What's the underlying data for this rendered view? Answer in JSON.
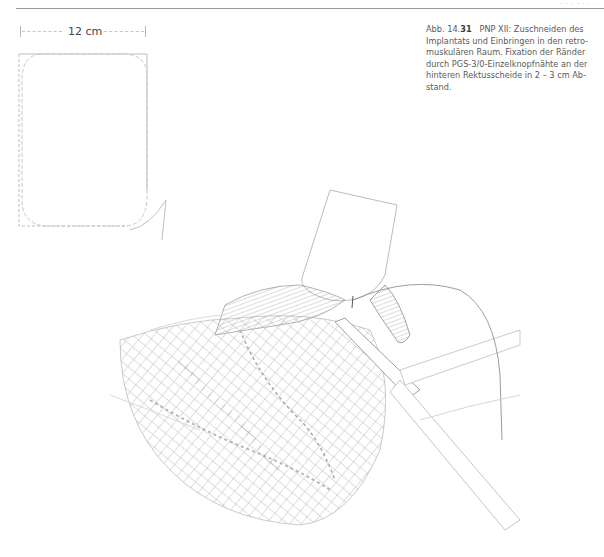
{
  "header": {
    "running_text": "· · · · · · ·"
  },
  "scale": {
    "label": "12 cm"
  },
  "caption": {
    "prefix": "Abb. 14.",
    "figure_number": "31",
    "text": "PNP XII: Zuschneiden des Implantats und Einbringen in den retro­muskulären Raum. Fixation der Ränder durch PGS-3/0-Einzelknopfnähte an der hinteren Rektusscheide in 2 – 3 cm Ab­stand."
  },
  "illustration": {
    "subject": "surgical-mesh-implantation-sketch",
    "template_shape": "rounded-rectangle-mesh-template"
  },
  "colors": {
    "ink": "#3a3a3a",
    "sketch_light": "#c4c4c4",
    "sketch_dark": "#7a7a7a",
    "background": "#ffffff"
  }
}
